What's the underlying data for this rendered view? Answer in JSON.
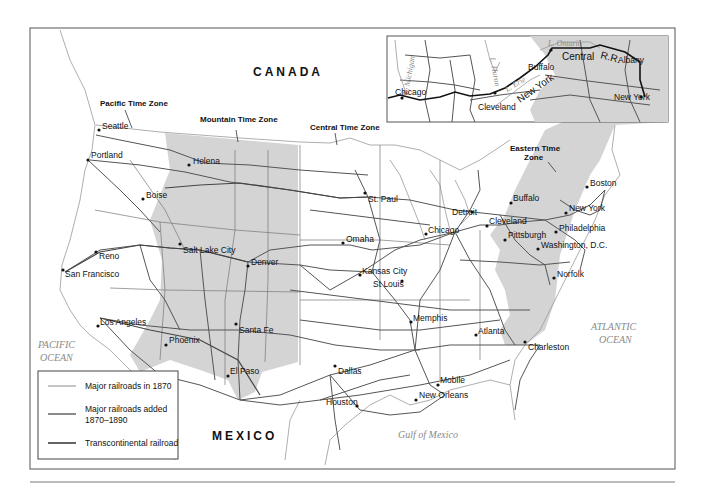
{
  "map": {
    "title": "Railroads of the United States, 1870–1890",
    "colors": {
      "zone_shade": "#d4d4d4",
      "railroad_1870": "#8c8c8c",
      "railroad_added": "#4d4d4d",
      "transcontinental": "#111111",
      "ocean_label": "#8a8a8a",
      "frame": "#555555"
    },
    "countries": {
      "canada": "CANADA",
      "mexico": "MEXICO"
    },
    "water": {
      "pacific_line1": "PACIFIC",
      "pacific_line2": "OCEAN",
      "atlantic_line1": "ATLANTIC",
      "atlantic_line2": "OCEAN",
      "gulf": "Gulf of Mexico"
    },
    "time_zones": {
      "pacific": "Pacific Time Zone",
      "mountain": "Mountain Time Zone",
      "central": "Central Time Zone",
      "eastern_line1": "Eastern Time",
      "eastern_line2": "Zone"
    },
    "cities": [
      {
        "name": "Seattle"
      },
      {
        "name": "Portland"
      },
      {
        "name": "Helena"
      },
      {
        "name": "Boise"
      },
      {
        "name": "Reno"
      },
      {
        "name": "San Francisco"
      },
      {
        "name": "Salt Lake City"
      },
      {
        "name": "Denver"
      },
      {
        "name": "Los Angeles"
      },
      {
        "name": "Phoenix"
      },
      {
        "name": "Santa Fe"
      },
      {
        "name": "El Paso"
      },
      {
        "name": "St. Paul"
      },
      {
        "name": "Omaha"
      },
      {
        "name": "Kansas City"
      },
      {
        "name": "St Louis"
      },
      {
        "name": "Chicago"
      },
      {
        "name": "Detroit"
      },
      {
        "name": "Cleveland"
      },
      {
        "name": "Pittsburgh"
      },
      {
        "name": "Buffalo"
      },
      {
        "name": "Boston"
      },
      {
        "name": "New York"
      },
      {
        "name": "Philadelphia"
      },
      {
        "name": "Washington, D.C."
      },
      {
        "name": "Norfolk"
      },
      {
        "name": "Memphis"
      },
      {
        "name": "Atlanta"
      },
      {
        "name": "Charleston"
      },
      {
        "name": "Dallas"
      },
      {
        "name": "Houston"
      },
      {
        "name": "New Orleans"
      },
      {
        "name": "Mobile"
      }
    ],
    "inset": {
      "lakes": {
        "michigan": "L. Michigan",
        "huron": "L. Huron",
        "erie": "L. Erie",
        "ontario": "L. Ontario"
      },
      "cities": {
        "chicago": "Chicago",
        "cleveland": "Cleveland",
        "buffalo": "Buffalo",
        "albany": "Albany",
        "new_york": "New York"
      },
      "railroad_label_1": "New York",
      "railroad_label_2": "Central",
      "railroad_label_3": "R.R."
    },
    "legend": {
      "items": [
        {
          "label": "Major railroads in 1870"
        },
        {
          "label_line1": "Major railroads added",
          "label_line2": "1870–1890"
        },
        {
          "label": "Transcontinental railroad"
        }
      ]
    }
  }
}
